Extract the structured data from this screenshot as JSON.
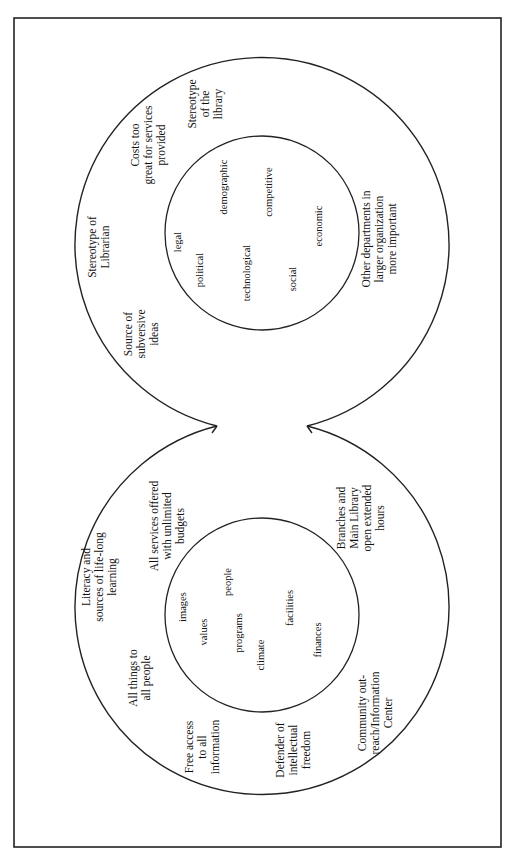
{
  "diagram": {
    "orientation": "rotated 90° counter-clockwise",
    "colors": {
      "stroke": "#222222",
      "background": "#ffffff",
      "text": "#111111"
    },
    "left_lobe": {
      "inner_factors": [
        "images",
        "people",
        "values",
        "programs",
        "climate",
        "facilities",
        "finances"
      ],
      "outer_labels": [
        {
          "lines": [
            "Literacy and",
            "sources of life-long",
            "learning"
          ]
        },
        {
          "lines": [
            "All services offered",
            "with unlimited",
            "budgets"
          ]
        },
        {
          "lines": [
            "All things to",
            "all people"
          ]
        },
        {
          "lines": [
            "Free access",
            "to all",
            "information"
          ]
        },
        {
          "lines": [
            "Defender of",
            "intellectual",
            "freedom"
          ]
        },
        {
          "lines": [
            "Community out-",
            "reach/Information",
            "Center"
          ]
        },
        {
          "lines": [
            "Branches and",
            "Main Library",
            "open extended",
            "hours"
          ]
        }
      ]
    },
    "right_lobe": {
      "inner_factors": [
        "legal",
        "demographic",
        "political",
        "technological",
        "competitive",
        "social",
        "economic"
      ],
      "outer_labels": [
        {
          "lines": [
            "Stereotype of",
            "Librarian"
          ]
        },
        {
          "lines": [
            "Costs too",
            "great for services",
            "provided"
          ]
        },
        {
          "lines": [
            "Stereotype",
            "of the",
            "library"
          ]
        },
        {
          "lines": [
            "Source of",
            "subversive",
            "ideas"
          ]
        },
        {
          "lines": [
            "Other departments in",
            "larger organization",
            "more important"
          ]
        }
      ]
    }
  }
}
